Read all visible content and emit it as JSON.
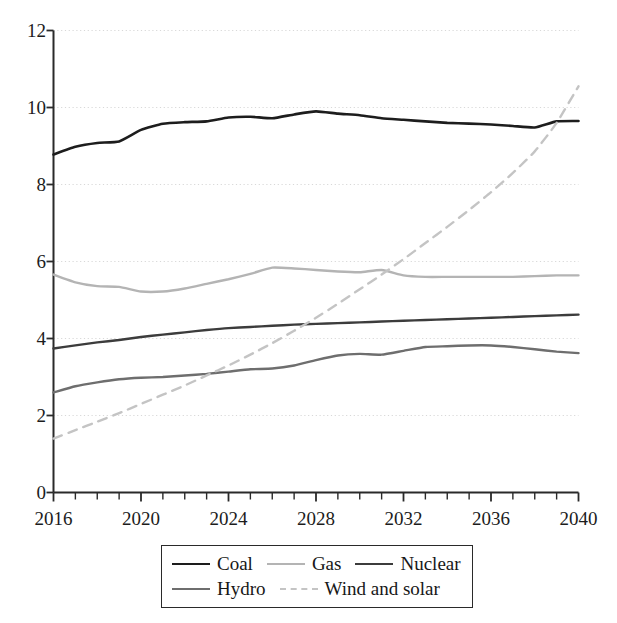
{
  "chart_data": {
    "type": "line",
    "title": "",
    "subtitle": "",
    "xlabel": "",
    "ylabel": "",
    "xlim": [
      2016,
      2040
    ],
    "ylim": [
      0,
      12
    ],
    "ytick_values": [
      0,
      2,
      4,
      6,
      8,
      10,
      12
    ],
    "ytick_labels": [
      "0",
      "2",
      "4",
      "6",
      "8",
      "10",
      "12"
    ],
    "xtick_values": [
      2016,
      2020,
      2024,
      2028,
      2032,
      2036,
      2040
    ],
    "xtick_labels": [
      "2016",
      "2020",
      "2024",
      "2028",
      "2032",
      "2036",
      "2040"
    ],
    "minor_xticks_every": 1,
    "grid": "horizontal-dotted",
    "legend_position": "below-axis",
    "x": [
      2016,
      2017,
      2018,
      2019,
      2020,
      2021,
      2022,
      2023,
      2024,
      2025,
      2026,
      2027,
      2028,
      2029,
      2030,
      2031,
      2032,
      2033,
      2034,
      2035,
      2036,
      2037,
      2038,
      2039,
      2040
    ],
    "series": [
      {
        "name": "Coal",
        "color": "#1d1d1d",
        "style": "solid",
        "width": 2.6,
        "values": [
          8.78,
          8.98,
          9.08,
          9.12,
          9.42,
          9.58,
          9.62,
          9.64,
          9.74,
          9.76,
          9.72,
          9.82,
          9.9,
          9.84,
          9.8,
          9.72,
          9.68,
          9.64,
          9.6,
          9.58,
          9.56,
          9.52,
          9.48,
          9.64,
          9.65
        ]
      },
      {
        "name": "Gas",
        "color": "#b4b4b4",
        "style": "solid",
        "width": 2.4,
        "values": [
          5.66,
          5.46,
          5.36,
          5.34,
          5.22,
          5.22,
          5.3,
          5.42,
          5.54,
          5.68,
          5.84,
          5.82,
          5.78,
          5.74,
          5.72,
          5.78,
          5.64,
          5.6,
          5.6,
          5.6,
          5.6,
          5.6,
          5.62,
          5.64,
          5.64
        ]
      },
      {
        "name": "Nuclear",
        "color": "#3c3c3c",
        "style": "solid",
        "width": 2.4,
        "values": [
          3.74,
          3.82,
          3.9,
          3.96,
          4.04,
          4.1,
          4.16,
          4.22,
          4.27,
          4.3,
          4.33,
          4.36,
          4.38,
          4.4,
          4.42,
          4.44,
          4.46,
          4.48,
          4.5,
          4.52,
          4.54,
          4.56,
          4.58,
          4.6,
          4.62
        ]
      },
      {
        "name": "Hydro",
        "color": "#6e6e6e",
        "style": "solid",
        "width": 2.4,
        "values": [
          2.6,
          2.76,
          2.86,
          2.94,
          2.98,
          3.0,
          3.04,
          3.08,
          3.14,
          3.2,
          3.22,
          3.3,
          3.44,
          3.56,
          3.6,
          3.58,
          3.68,
          3.78,
          3.8,
          3.82,
          3.82,
          3.78,
          3.72,
          3.66,
          3.62
        ]
      },
      {
        "name": "Wind and solar",
        "color": "#c4c4c4",
        "style": "dashed",
        "width": 2.4,
        "values": [
          1.4,
          1.62,
          1.84,
          2.06,
          2.3,
          2.54,
          2.78,
          3.04,
          3.3,
          3.58,
          3.88,
          4.2,
          4.54,
          4.9,
          5.28,
          5.66,
          6.06,
          6.48,
          6.9,
          7.34,
          7.8,
          8.3,
          8.86,
          9.6,
          10.55
        ]
      }
    ],
    "legend": {
      "rows": [
        [
          {
            "label": "Coal",
            "color": "#1d1d1d",
            "style": "solid",
            "width": 2.6
          },
          {
            "label": "Gas",
            "color": "#b4b4b4",
            "style": "solid",
            "width": 2.4
          },
          {
            "label": "Nuclear",
            "color": "#3c3c3c",
            "style": "solid",
            "width": 2.4
          }
        ],
        [
          {
            "label": "Hydro",
            "color": "#6e6e6e",
            "style": "solid",
            "width": 2.4
          },
          {
            "label": "Wind and solar",
            "color": "#c4c4c4",
            "style": "dashed",
            "width": 2.4
          }
        ]
      ]
    },
    "axis_color": "#2a2a2a",
    "grid_color": "#d8d8d8"
  }
}
